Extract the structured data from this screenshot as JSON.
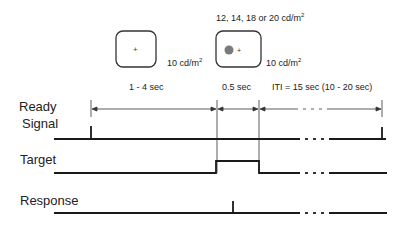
{
  "stimuli": {
    "fixation": {
      "luminance": "10 cd/m",
      "sup": "2"
    },
    "target": {
      "top_label": "12, 14, 18 or 20 cd/m",
      "top_sup": "2",
      "luminance": "10 cd/m",
      "sup": "2"
    }
  },
  "intervals": {
    "pre": "1 - 4 sec",
    "target": "0.5 sec",
    "iti": "ITI = 15 sec (10 - 20 sec)"
  },
  "rows": {
    "ready_line1": "Ready",
    "ready_line2": "Signal",
    "target": "Target",
    "response": "Response"
  },
  "colors": {
    "line": "#1a1a1a",
    "dot": "#7a7a7a"
  }
}
